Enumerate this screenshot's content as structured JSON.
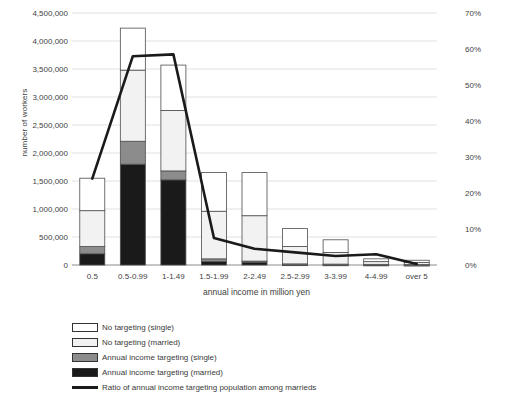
{
  "chart_data": {
    "type": "bar",
    "title": "",
    "xlabel": "annual income in million yen",
    "ylabel": "number of workers",
    "y2label": "",
    "grid": true,
    "legend_position": "bottom-left",
    "categories": [
      "0.5",
      "0.5-0.99",
      "1-1.49",
      "1.5-1.99",
      "2-2.49",
      "2.5-2.99",
      "3-3.99",
      "4-4.99",
      "over 5"
    ],
    "ylim": [
      0,
      4500000
    ],
    "yticks": [
      0,
      500000,
      1000000,
      1500000,
      2000000,
      2500000,
      3000000,
      3500000,
      4000000,
      4500000
    ],
    "ytick_labels": [
      "0",
      "500,000",
      "1,000,000",
      "1,500,000",
      "2,000,000",
      "2,500,000",
      "3,000,000",
      "3,500,000",
      "4,000,000",
      "4,500,000"
    ],
    "y2lim": [
      0,
      70
    ],
    "y2ticks": [
      0,
      10,
      20,
      30,
      40,
      50,
      60,
      70
    ],
    "y2tick_labels": [
      "0%",
      "10%",
      "20%",
      "30%",
      "40%",
      "50%",
      "60%",
      "70%"
    ],
    "stacked": true,
    "series": [
      {
        "name": "Annual income targeting (married)",
        "type": "bar",
        "color": "#1a1a1a",
        "axis": "left",
        "values": [
          200000,
          1800000,
          1520000,
          60000,
          50000,
          10000,
          8000,
          6000,
          4000
        ]
      },
      {
        "name": "Annual income targeting (single)",
        "type": "bar",
        "color": "#8c8c8c",
        "axis": "left",
        "values": [
          130000,
          410000,
          160000,
          50000,
          20000,
          10000,
          8000,
          6000,
          4000
        ]
      },
      {
        "name": "No targeting (married)",
        "type": "bar",
        "color": "#f2f2f2",
        "axis": "left",
        "values": [
          640000,
          1270000,
          1080000,
          850000,
          810000,
          310000,
          209000,
          48000,
          37000
        ]
      },
      {
        "name": "No targeting (single)",
        "type": "bar",
        "color": "#ffffff",
        "axis": "left",
        "values": [
          580000,
          750000,
          810000,
          690000,
          770000,
          320000,
          225000,
          50000,
          40000
        ]
      },
      {
        "name": "Ratio of annual income targeting population among marrieds",
        "type": "line",
        "color": "#1a1a1a",
        "axis": "right",
        "values": [
          24.0,
          58.0,
          58.5,
          7.5,
          4.5,
          3.5,
          2.5,
          3.0,
          0.3
        ]
      }
    ],
    "bar_totals": [
      1550000,
      4230000,
      3570000,
      1650000,
      1650000,
      650000,
      450000,
      110000,
      85000
    ]
  },
  "legend": {
    "items": [
      {
        "label": "No targeting (single)",
        "swatch": "white-swatch",
        "kind": "box",
        "color": "#ffffff"
      },
      {
        "label": "No targeting (married)",
        "swatch": "light-gray-swatch",
        "kind": "box",
        "color": "#f2f2f2"
      },
      {
        "label": "Annual income targeting (single)",
        "swatch": "gray-swatch",
        "kind": "box",
        "color": "#8c8c8c"
      },
      {
        "label": "Annual income targeting (married)",
        "swatch": "black-swatch",
        "kind": "box",
        "color": "#1a1a1a"
      },
      {
        "label": "Ratio of annual income targeting population among marrieds",
        "swatch": "black-line-swatch",
        "kind": "line",
        "color": "#1a1a1a"
      }
    ]
  },
  "colors": {
    "gridline": "#d9d9d9",
    "bar_border": "#4d4d4d",
    "line": "#1a1a1a",
    "text": "#3f3f3f",
    "background": "#ffffff"
  }
}
